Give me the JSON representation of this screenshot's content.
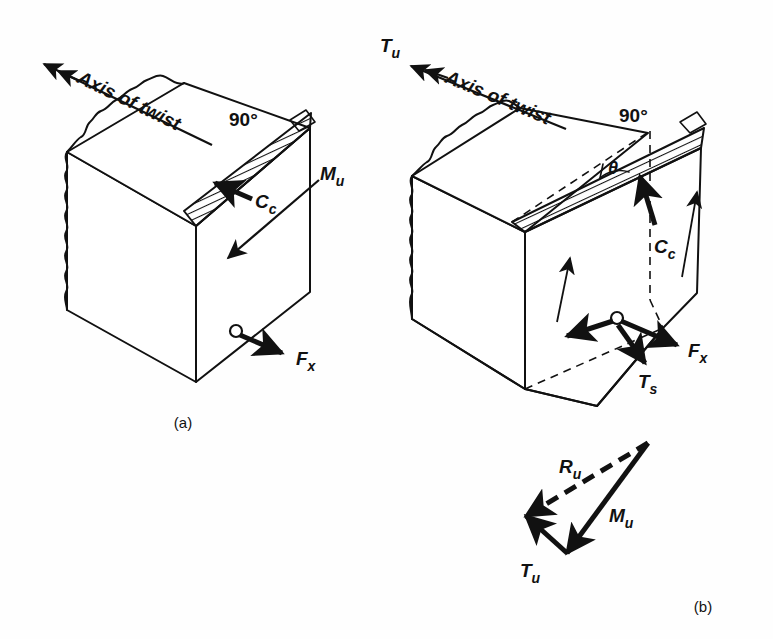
{
  "figure": {
    "background_color": "#fefefe",
    "line_color": "#111111",
    "panels": [
      {
        "id": "a",
        "caption": "(a)",
        "description": "Beam end block with skew bending crack plane normal to axis of twist",
        "labels": [
          {
            "name": "axis-of-twist",
            "text": "Axis of twist"
          },
          {
            "name": "angle-90",
            "text": "90°"
          },
          {
            "name": "compression-force",
            "text": "C",
            "sub": "c"
          },
          {
            "name": "ultimate-moment",
            "text": "M",
            "sub": "u"
          },
          {
            "name": "longitudinal-force",
            "text": "F",
            "sub": "x"
          }
        ]
      },
      {
        "id": "b",
        "caption": "(b)",
        "description": "Beam end block with skew failure surface inclined at angle theta, showing torsion",
        "labels": [
          {
            "name": "ultimate-torque",
            "text": "T",
            "sub": "u"
          },
          {
            "name": "axis-of-twist",
            "text": "Axis of twist"
          },
          {
            "name": "angle-90",
            "text": "90°"
          },
          {
            "name": "skew-angle",
            "text": "θ"
          },
          {
            "name": "compression-force",
            "text": "C",
            "sub": "c"
          },
          {
            "name": "longitudinal-force",
            "text": "F",
            "sub": "x"
          },
          {
            "name": "torsion-shear-force",
            "text": "T",
            "sub": "s"
          }
        ]
      },
      {
        "id": "b-vector-triangle",
        "caption": "(b)",
        "description": "Vector triangle of resultant moment",
        "labels": [
          {
            "name": "resultant-moment",
            "text": "R",
            "sub": "u"
          },
          {
            "name": "ultimate-moment",
            "text": "M",
            "sub": "u"
          },
          {
            "name": "ultimate-torque",
            "text": "T",
            "sub": "u"
          }
        ]
      }
    ]
  },
  "text": {
    "axis_of_twist_a": "Axis of twist",
    "axis_of_twist_b": "Axis of twist",
    "angle_90_a": "90°",
    "angle_90_b": "90°",
    "theta": "θ",
    "Cc_a_main": "C",
    "Cc_a_sub": "c",
    "Mu_a_main": "M",
    "Mu_a_sub": "u",
    "Fx_a_main": "F",
    "Fx_a_sub": "x",
    "Tu_b_main": "T",
    "Tu_b_sub": "u",
    "Cc_b_main": "C",
    "Cc_b_sub": "c",
    "Fx_b_main": "F",
    "Fx_b_sub": "x",
    "Ts_b_main": "T",
    "Ts_b_sub": "s",
    "Ru_tri_main": "R",
    "Ru_tri_sub": "u",
    "Mu_tri_main": "M",
    "Mu_tri_sub": "u",
    "Tu_tri_main": "T",
    "Tu_tri_sub": "u",
    "caption_a": "(a)",
    "caption_b": "(b)"
  }
}
